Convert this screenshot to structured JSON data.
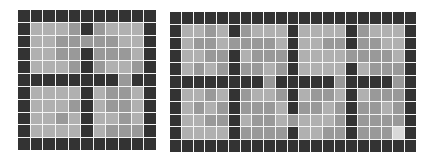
{
  "palette": {
    "D": "#333333",
    "L": "#b0b0b0",
    "M": "#999999",
    "W": "#d9d9d9"
  },
  "grids": [
    {
      "name": "left-grid",
      "left": 18,
      "top": 10,
      "width": 138,
      "height": 140,
      "cols": 11,
      "rows": 11,
      "cells": [
        "DDDDDDDDDDD",
        "DLLLMDMLLLD",
        "DLLMMMMMLLD",
        "DLLMMDMMMLD",
        "DLLLMDMLLMD",
        "DDDDDDDDMDD",
        "DLLLLDLMMLD",
        "DLLLMDLMMLD",
        "DLLMLDLLMLD",
        "DLLLLDLMMMD",
        "DDDDDDDDDDD"
      ]
    },
    {
      "name": "right-grid",
      "left": 170,
      "top": 12,
      "width": 246,
      "height": 140,
      "cols": 21,
      "rows": 11,
      "cells": [
        "DDDDDDDDDDDDDDDDDDDDD",
        "DLLMLDMLLLDLLLLDMLLLD",
        "DLMMLMMMMLDLLMMDMMLLD",
        "DLLMMDLMMMDLLLLMMMMLD",
        "DLMLMDMMLMDLLLLDLMMMD",
        "DDDDDDDDMDDDDDMDDDDMD",
        "DLLMLDMLLMDLMMLDLMMMD",
        "DLMLMDMMMLDMMLMDMMLMD",
        "DLLMMDLMMLMLLLMDMMMMD",
        "DLLLLDMMMMDLLMMDMMMWD",
        "DDDDDDDDDDDDDDDDDDDDD"
      ]
    }
  ]
}
